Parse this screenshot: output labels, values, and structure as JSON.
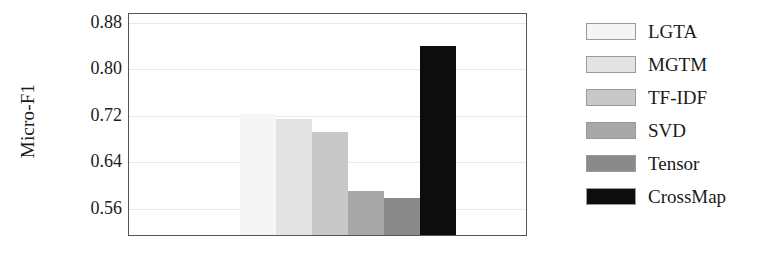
{
  "chart_data": {
    "type": "bar",
    "title": "",
    "xlabel": "",
    "ylabel": "Micro-F1",
    "categories": [
      "LGTA",
      "MGTM",
      "TF-IDF",
      "SVD",
      "Tensor",
      "CrossMap"
    ],
    "values": [
      0.72,
      0.711,
      0.689,
      0.587,
      0.576,
      0.837
    ],
    "ylim": [
      0.512,
      0.895
    ],
    "yticks": [
      0.56,
      0.64,
      0.72,
      0.8,
      0.88
    ],
    "ytick_labels": [
      "0.56",
      "0.64",
      "0.72",
      "0.80",
      "0.88"
    ],
    "grid": true,
    "legend_position": "right",
    "series": [
      {
        "name": "LGTA",
        "value": 0.72,
        "color": "#f5f5f5"
      },
      {
        "name": "MGTM",
        "value": 0.711,
        "color": "#e3e3e3"
      },
      {
        "name": "TF-IDF",
        "value": 0.689,
        "color": "#c8c8c8"
      },
      {
        "name": "SVD",
        "value": 0.587,
        "color": "#a8a8a8"
      },
      {
        "name": "Tensor",
        "value": 0.576,
        "color": "#8a8a8a"
      },
      {
        "name": "CrossMap",
        "value": 0.837,
        "color": "#0d0d0d"
      }
    ]
  }
}
